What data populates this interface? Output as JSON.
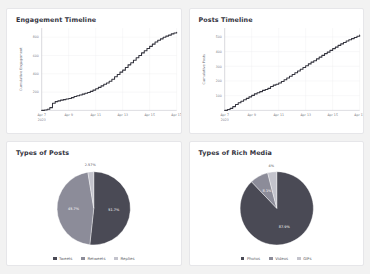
{
  "panels": {
    "engagement": {
      "title": "Engagement Timeline"
    },
    "posts": {
      "title": "Posts Timeline"
    },
    "types_of_posts": {
      "title": "Types of Posts"
    },
    "rich_media": {
      "title": "Types of Rich Media"
    }
  },
  "colors": {
    "slice_dark": "#4a4a55",
    "slice_mid": "#8c8c99",
    "slice_light": "#c3c3cc",
    "line": "#35353f",
    "card_bg": "#ffffff",
    "page_bg": "#f2f2f2"
  },
  "chart_data": [
    {
      "type": "line",
      "title": "Engagement Timeline",
      "xlabel": "",
      "ylabel": "Cumulative Engagement",
      "ylim": [
        0,
        900
      ],
      "yticks": [
        200,
        400,
        600,
        800
      ],
      "ytick_labels": [
        "200",
        "400",
        "600",
        "800"
      ],
      "xtick_labels": [
        "Apr 7\n2023",
        "Apr 9",
        "Apr 11",
        "Apr 13",
        "Apr 15",
        "Apr 17"
      ],
      "xtick_primary": [
        "Apr 7",
        "Apr 9",
        "Apr 11",
        "Apr 13",
        "Apr 15",
        "Apr 17"
      ],
      "xtick_secondary": [
        "2023",
        "",
        "",
        "",
        "",
        ""
      ],
      "grid": true,
      "legend": "none",
      "x": [
        0,
        0.2,
        0.4,
        0.6,
        0.8,
        1.0,
        1.2,
        1.4,
        1.6,
        1.8,
        2.0,
        2.2,
        2.4,
        2.6,
        2.8,
        3.0,
        3.2,
        3.4,
        3.6,
        3.8,
        4.0,
        4.2,
        4.4,
        4.6,
        4.8,
        5.0,
        5.2,
        5.4,
        5.6,
        5.8,
        6.0,
        6.2,
        6.4,
        6.6,
        6.8,
        7.0,
        7.2,
        7.4,
        7.6,
        7.8,
        8.0,
        8.2,
        8.4,
        8.6,
        8.8,
        9.0,
        9.2,
        9.4,
        9.6,
        9.8,
        10.0
      ],
      "values": [
        0,
        5,
        12,
        30,
        78,
        96,
        104,
        112,
        118,
        124,
        130,
        140,
        152,
        160,
        168,
        178,
        188,
        196,
        208,
        222,
        236,
        252,
        268,
        286,
        300,
        318,
        340,
        368,
        392,
        418,
        440,
        468,
        498,
        520,
        548,
        576,
        600,
        628,
        652,
        676,
        700,
        724,
        748,
        766,
        782,
        800,
        812,
        822,
        836,
        846,
        852
      ]
    },
    {
      "type": "line",
      "title": "Posts Timeline",
      "xlabel": "",
      "ylabel": "Cumulative Posts",
      "ylim": [
        0,
        560
      ],
      "yticks": [
        100,
        200,
        300,
        400,
        500
      ],
      "ytick_labels": [
        "100",
        "200",
        "300",
        "400",
        "500"
      ],
      "xtick_labels": [
        "Apr 7\n2023",
        "Apr 9",
        "Apr 11",
        "Apr 13",
        "Apr 15",
        "Apr 17"
      ],
      "xtick_primary": [
        "Apr 7",
        "Apr 9",
        "Apr 11",
        "Apr 13",
        "Apr 15",
        "Apr 17"
      ],
      "xtick_secondary": [
        "2023",
        "",
        "",
        "",
        "",
        ""
      ],
      "grid": true,
      "legend": "none",
      "x": [
        0,
        0.2,
        0.4,
        0.6,
        0.8,
        1.0,
        1.2,
        1.4,
        1.6,
        1.8,
        2.0,
        2.2,
        2.4,
        2.6,
        2.8,
        3.0,
        3.2,
        3.4,
        3.6,
        3.8,
        4.0,
        4.2,
        4.4,
        4.6,
        4.8,
        5.0,
        5.2,
        5.4,
        5.6,
        5.8,
        6.0,
        6.2,
        6.4,
        6.6,
        6.8,
        7.0,
        7.2,
        7.4,
        7.6,
        7.8,
        8.0,
        8.2,
        8.4,
        8.6,
        8.8,
        9.0,
        9.2,
        9.4,
        9.6,
        9.8,
        10.0
      ],
      "values": [
        0,
        6,
        14,
        26,
        40,
        52,
        62,
        72,
        82,
        92,
        102,
        112,
        120,
        128,
        136,
        142,
        150,
        162,
        172,
        178,
        186,
        196,
        208,
        220,
        232,
        244,
        256,
        268,
        280,
        292,
        304,
        316,
        328,
        338,
        350,
        362,
        374,
        386,
        396,
        408,
        420,
        430,
        442,
        452,
        462,
        472,
        480,
        488,
        496,
        504,
        512
      ]
    },
    {
      "type": "pie",
      "title": "Types of Posts",
      "labels": [
        "Tweets",
        "Retweets",
        "Replies"
      ],
      "values": [
        51.7,
        45.7,
        2.57
      ],
      "display_labels": [
        "51.7%",
        "45.7%",
        "2.57%"
      ],
      "colors": [
        "#4a4a55",
        "#8c8c99",
        "#c3c3cc"
      ],
      "legend": "bottom"
    },
    {
      "type": "pie",
      "title": "Types of Rich Media",
      "labels": [
        "Photos",
        "Videos",
        "GIFs"
      ],
      "values": [
        87.9,
        8.1,
        4.0
      ],
      "display_labels": [
        "87.9%",
        "8.1%",
        "4%"
      ],
      "colors": [
        "#4a4a55",
        "#8c8c99",
        "#c3c3cc"
      ],
      "legend": "bottom"
    }
  ]
}
